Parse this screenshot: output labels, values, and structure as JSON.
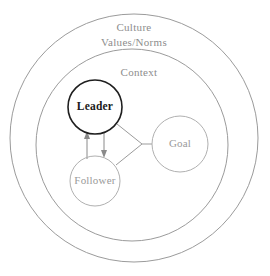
{
  "diagram": {
    "background_color": "#ffffff",
    "rings": [
      {
        "id": "culture",
        "label_lines": [
          "Culture",
          "Values/Norms"
        ],
        "label_line_1": "Culture",
        "label_line_2": "Values/Norms",
        "stroke_color": "#9b9b9b",
        "text_color": "#8d8d8d",
        "cx": 134,
        "cy": 138,
        "r": 124
      },
      {
        "id": "context",
        "label_lines": [
          "Context"
        ],
        "label_line_1": "Context",
        "stroke_color": "#9b9b9b",
        "text_color": "#8d8d8d",
        "cx": 132,
        "cy": 145,
        "r": 96
      }
    ],
    "nodes": [
      {
        "id": "leader",
        "label": "Leader",
        "emphasis": "strong",
        "stroke_color": "#1f1f1f",
        "text_color": "#1a1a1a",
        "cx": 95,
        "cy": 107,
        "r": 27
      },
      {
        "id": "follower",
        "label": "Follower",
        "emphasis": "muted",
        "stroke_color": "#b0b0b0",
        "text_color": "#9a9a9a",
        "cx": 95,
        "cy": 181,
        "r": 25
      },
      {
        "id": "goal",
        "label": "Goal",
        "emphasis": "muted",
        "stroke_color": "#b0b0b0",
        "text_color": "#9a9a9a",
        "cx": 180,
        "cy": 144,
        "r": 28
      }
    ],
    "connectors": [
      {
        "id": "leader-to-junction",
        "from": "leader",
        "to": "junction",
        "style": "plain-line"
      },
      {
        "id": "follower-to-junction",
        "from": "follower",
        "to": "junction",
        "style": "plain-line"
      },
      {
        "id": "junction-to-goal",
        "from": "junction",
        "to": "goal",
        "style": "plain-line"
      }
    ],
    "arrows": [
      {
        "id": "follower-to-leader",
        "from": "follower",
        "to": "leader",
        "direction": "up",
        "color": "#8a8a8a"
      },
      {
        "id": "leader-to-follower",
        "from": "leader",
        "to": "follower",
        "direction": "down",
        "color": "#8a8a8a"
      }
    ]
  }
}
